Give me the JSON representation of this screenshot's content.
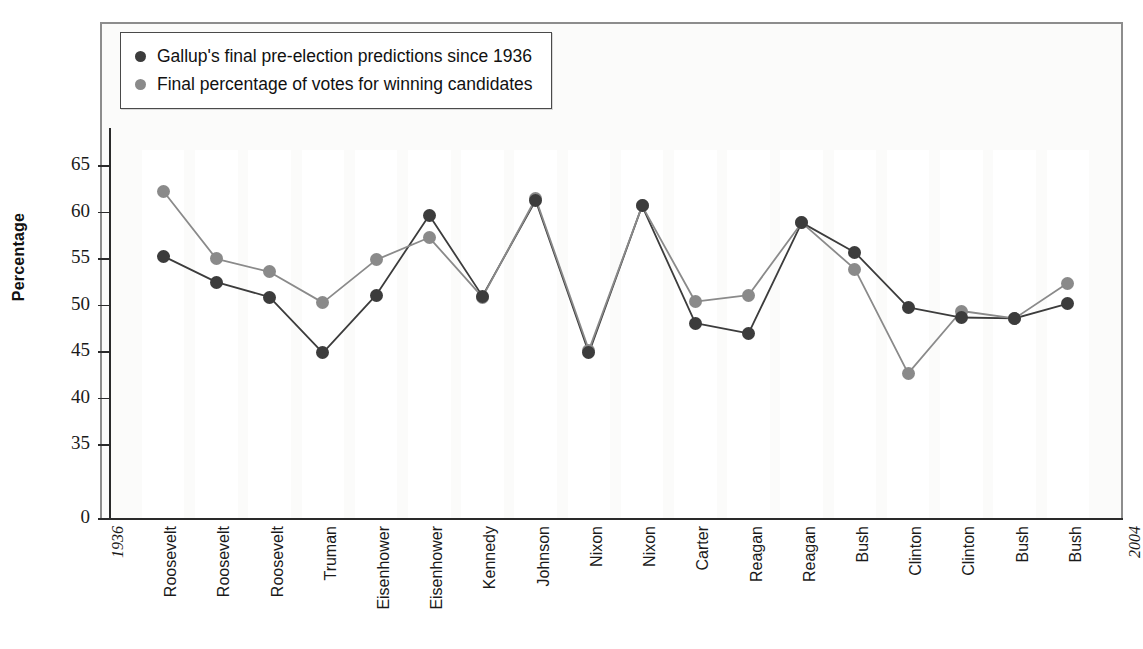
{
  "chart": {
    "type": "line",
    "ylabel": "Percentage",
    "y_ticks": [
      {
        "value": 0,
        "label": "0"
      },
      {
        "value": 35,
        "label": "35"
      },
      {
        "value": 40,
        "label": "40"
      },
      {
        "value": 45,
        "label": "45"
      },
      {
        "value": 50,
        "label": "50"
      },
      {
        "value": 55,
        "label": "55"
      },
      {
        "value": 60,
        "label": "60"
      },
      {
        "value": 65,
        "label": "65"
      }
    ],
    "start_year_label": "1936",
    "end_year_label": "2004"
  },
  "legend": {
    "position": "top-left",
    "entries": [
      {
        "label": "Gallup's final pre-election predictions since 1936",
        "color": "#3c3c3c",
        "icon": "legend-dot-dark"
      },
      {
        "label": "Final percentage of votes for winning candidates",
        "color": "#8a8a8a",
        "icon": "legend-dot-gray"
      }
    ]
  },
  "chart_data": {
    "type": "line",
    "title": "",
    "xlabel": "",
    "ylabel": "Percentage",
    "ylim": [
      33,
      68
    ],
    "y_broken_axis": true,
    "grid": false,
    "legend_position": "top-left",
    "categories": [
      "Roosevelt",
      "Roosevelt",
      "Roosevelt",
      "Truman",
      "Eisenhower",
      "Eisenhower",
      "Kennedy",
      "Johnson",
      "Nixon",
      "Nixon",
      "Carter",
      "Reagan",
      "Reagan",
      "Bush",
      "Clinton",
      "Clinton",
      "Bush",
      "Bush"
    ],
    "axis_end_labels": {
      "start": "1936",
      "end": "2004"
    },
    "series": [
      {
        "name": "Gallup's final pre-election predictions since 1936",
        "color": "#3c3c3c",
        "values": [
          55.2,
          52.4,
          50.8,
          44.8,
          51.0,
          59.6,
          50.9,
          61.2,
          44.8,
          60.6,
          48.0,
          46.9,
          58.8,
          55.6,
          49.7,
          48.6,
          48.5,
          50.1
        ]
      },
      {
        "name": "Final percentage of votes for winning candidates",
        "color": "#8a8a8a",
        "values": [
          62.2,
          54.9,
          53.5,
          50.2,
          54.8,
          57.2,
          50.8,
          61.4,
          45.1,
          60.6,
          50.3,
          51.0,
          58.8,
          53.8,
          42.6,
          49.3,
          48.5,
          52.3
        ]
      }
    ]
  }
}
